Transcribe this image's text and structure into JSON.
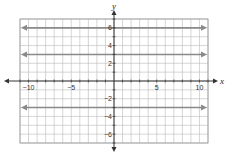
{
  "chart_data": {
    "type": "line",
    "title": "",
    "xlabel": "x",
    "ylabel": "y",
    "xlim": [
      -11,
      11
    ],
    "ylim": [
      -7,
      7
    ],
    "grid": true,
    "x_ticks": [
      -10,
      -5,
      5,
      10
    ],
    "y_ticks": [
      6,
      4,
      2,
      -2,
      -4,
      -6
    ],
    "x_tick_labels": [
      "−10",
      "−5",
      "5",
      "10"
    ],
    "y_tick_labels": [
      "6",
      "4",
      "2",
      "−2",
      "−4",
      "−6"
    ],
    "series": [
      {
        "name": "y = 6",
        "x": [
          -11,
          11
        ],
        "values": [
          6,
          6
        ],
        "arrows": "both"
      },
      {
        "name": "y = 3",
        "x": [
          -11,
          11
        ],
        "values": [
          3,
          3
        ],
        "arrows": "both"
      },
      {
        "name": "y = -3",
        "x": [
          -11,
          11
        ],
        "values": [
          -3,
          -3
        ],
        "arrows": "both"
      }
    ],
    "line_color": "#8a8a8a",
    "axis_color": "#333333",
    "grid_color": "#bbbbbb"
  }
}
